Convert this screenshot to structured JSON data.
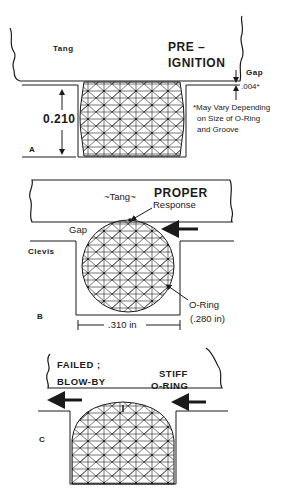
{
  "panels": {
    "a": {
      "letter": "A",
      "tang_label": "Tang",
      "state_line1": "PRE –",
      "state_line2": "IGNITION",
      "gap_label": "Gap",
      "gap_value": ".004*",
      "height_dimension": "0.210",
      "footnote_line1": "*May Vary Depending",
      "footnote_line2": "on Size of O-Ring",
      "footnote_line3": "and Groove"
    },
    "b": {
      "letter": "B",
      "tang_label": "~Tang~",
      "state_line1": "PROPER",
      "state_line2": "Response",
      "gap_label": "Gap",
      "clevis_label": "Clevis",
      "oring_label": "O-Ring",
      "oring_size": "(.280 in)",
      "width_dimension": ".310 in"
    },
    "c": {
      "letter": "C",
      "state_line1": "FAILED ;",
      "state_line2": "BLOW-BY",
      "cause_line1": "STIFF",
      "cause_line2": "O-RING"
    }
  },
  "colors": {
    "ink": "#1a1a1a",
    "background": "#ffffff"
  }
}
